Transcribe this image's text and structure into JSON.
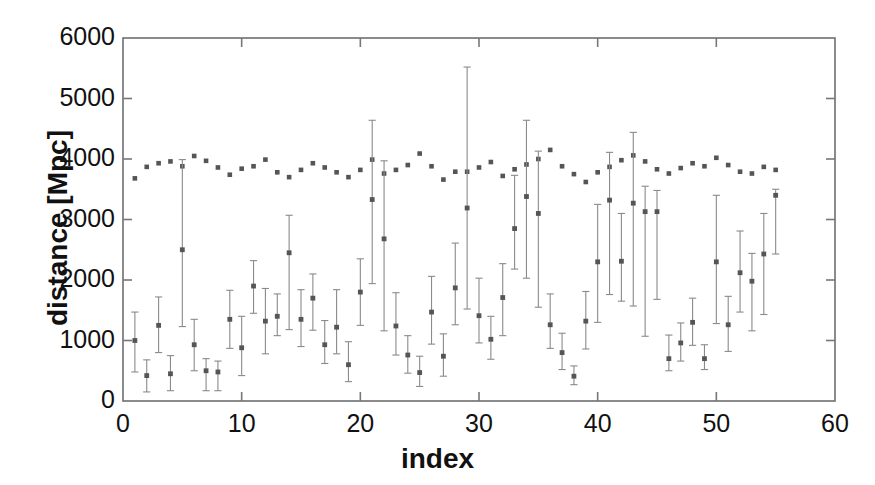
{
  "chart_data": {
    "type": "scatter",
    "title": "",
    "xlabel": "index",
    "ylabel": "distance  [Mpc]",
    "xlim": [
      0,
      60
    ],
    "ylim": [
      0,
      6000
    ],
    "xticks": [
      0,
      10,
      20,
      30,
      40,
      50,
      60
    ],
    "yticks": [
      0,
      1000,
      2000,
      3000,
      4000,
      5000,
      6000
    ],
    "xtick_labels": [
      "0",
      "10",
      "20",
      "30",
      "40",
      "50",
      "60"
    ],
    "ytick_labels": [
      "0",
      "1000",
      "2000",
      "3000",
      "4000",
      "5000",
      "6000"
    ],
    "grid": false,
    "legend": "none",
    "marker_color": "#555555",
    "errorbar_color": "#8a8a8a",
    "axis_color": "#777777",
    "series": [
      {
        "name": "upper-series-no-errorbars",
        "marker": "dot",
        "has_errorbars": false,
        "x": [
          1,
          2,
          3,
          4,
          5,
          6,
          7,
          8,
          9,
          10,
          11,
          12,
          13,
          14,
          15,
          16,
          17,
          18,
          19,
          20,
          21,
          22,
          23,
          24,
          25,
          26,
          27,
          28,
          29,
          30,
          31,
          32,
          33,
          34,
          35,
          36,
          37,
          38,
          39,
          40,
          41,
          42,
          43,
          44,
          45,
          46,
          47,
          48,
          49,
          50,
          51,
          52,
          53,
          54,
          55
        ],
        "values": [
          3680,
          3870,
          3930,
          3960,
          3880,
          4050,
          3970,
          3860,
          3740,
          3840,
          3880,
          3990,
          3780,
          3700,
          3820,
          3930,
          3860,
          3780,
          3700,
          3820,
          3990,
          3760,
          3820,
          3900,
          4090,
          3880,
          3660,
          3790,
          3790,
          3860,
          3950,
          3720,
          3830,
          3910,
          4000,
          4150,
          3880,
          3750,
          3620,
          3780,
          3870,
          3980,
          4060,
          3960,
          3830,
          3760,
          3850,
          3930,
          3880,
          4020,
          3900,
          3790,
          3760,
          3870,
          3820
        ]
      },
      {
        "name": "lower-series-with-errorbars",
        "marker": "dot",
        "has_errorbars": true,
        "x": [
          1,
          2,
          3,
          4,
          5,
          6,
          7,
          8,
          9,
          10,
          11,
          12,
          13,
          14,
          15,
          16,
          17,
          18,
          19,
          20,
          21,
          22,
          23,
          24,
          25,
          26,
          27,
          28,
          29,
          30,
          31,
          32,
          33,
          34,
          35,
          36,
          37,
          38,
          39,
          40,
          41,
          42,
          43,
          44,
          45,
          46,
          47,
          48,
          49,
          50,
          51,
          52,
          53,
          54,
          55
        ],
        "values": [
          1000,
          420,
          1250,
          450,
          2500,
          930,
          500,
          480,
          1350,
          880,
          1900,
          1320,
          1400,
          2450,
          1350,
          1700,
          930,
          1220,
          600,
          1800,
          3330,
          2680,
          1240,
          760,
          470,
          1470,
          740,
          1870,
          3190,
          1410,
          1020,
          1710,
          2850,
          3380,
          3100,
          1260,
          800,
          410,
          1320,
          2300,
          3320,
          2310,
          3270,
          3130,
          3130,
          700,
          960,
          1300,
          700,
          2300,
          1260,
          2120,
          1980,
          2430,
          3400
        ],
        "err_low": [
          480,
          150,
          800,
          170,
          1230,
          500,
          170,
          170,
          870,
          420,
          1450,
          780,
          1080,
          1180,
          900,
          1170,
          620,
          780,
          320,
          1250,
          1940,
          1160,
          760,
          460,
          240,
          940,
          410,
          1260,
          1520,
          960,
          690,
          1080,
          2180,
          2030,
          1550,
          870,
          520,
          270,
          860,
          1300,
          1760,
          1650,
          1570,
          1070,
          1680,
          500,
          660,
          920,
          520,
          1280,
          820,
          1470,
          1160,
          1430,
          2430
        ],
        "err_high": [
          1470,
          680,
          1720,
          750,
          3990,
          1350,
          700,
          660,
          1830,
          1400,
          2320,
          1860,
          1770,
          3070,
          1840,
          2100,
          1330,
          1840,
          980,
          2350,
          4640,
          3970,
          1790,
          1080,
          740,
          2060,
          1110,
          2610,
          5520,
          2030,
          1400,
          2270,
          3730,
          4640,
          4130,
          1770,
          1120,
          580,
          1810,
          3250,
          4110,
          3100,
          4440,
          3550,
          3480,
          1090,
          1290,
          1700,
          930,
          3400,
          1730,
          2810,
          2440,
          3100,
          3500
        ]
      }
    ]
  },
  "axes": {
    "frame_color": "#6f6f6f"
  }
}
